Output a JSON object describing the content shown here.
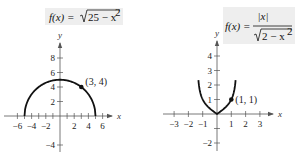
{
  "chart_data": [
    {
      "type": "line",
      "title": "f(x) = √(25 − x²)",
      "formula": {
        "lhs": "f(x) =",
        "radicand": "25 − x",
        "exponent": "2"
      },
      "function": "sqrt(25 - x^2)",
      "domain": [
        -5,
        5
      ],
      "xlabel": "x",
      "ylabel": "y",
      "xlim": [
        -6.5,
        7
      ],
      "ylim": [
        -4.5,
        9.5
      ],
      "x_ticks": [
        -6,
        -4,
        -2,
        2,
        4,
        6
      ],
      "x_tick_labels": [
        "−6",
        "−4",
        "−2",
        "2",
        "4",
        "6"
      ],
      "y_ticks": [
        -4,
        2,
        4,
        6,
        8
      ],
      "y_tick_labels": [
        "−4",
        "2",
        "4",
        "6",
        "8"
      ],
      "x_minor_ticks": [
        -5,
        -3,
        -1,
        1,
        3,
        5
      ],
      "points": [
        {
          "x": 3,
          "y": 4,
          "label": "(3, 4)"
        }
      ],
      "grid": false,
      "colors": {
        "curve": "#111111",
        "axis": "#555555",
        "formula_bg": "#eeeeee"
      }
    },
    {
      "type": "line",
      "title": "f(x) = |x| / √(2 − x²)",
      "formula": {
        "lhs": "f(x) =",
        "numerator": "|x|",
        "radicand": "2 − x",
        "exponent": "2"
      },
      "function": "abs(x) / sqrt(2 - x^2)",
      "domain": [
        -1.3,
        1.3
      ],
      "xlabel": "x",
      "ylabel": "y",
      "xlim": [
        -3.3,
        3.8
      ],
      "ylim": [
        -2.5,
        5
      ],
      "x_ticks": [
        -3,
        -2,
        -1,
        1,
        2,
        3
      ],
      "x_tick_labels": [
        "−3",
        "−2",
        "−1",
        "1",
        "2",
        "3"
      ],
      "y_ticks": [
        -2,
        -1,
        1,
        2,
        3,
        4
      ],
      "y_tick_labels": [
        "−2",
        "",
        "1",
        "2",
        "3",
        "4"
      ],
      "points": [
        {
          "x": 1,
          "y": 1,
          "label": "(1, 1)"
        }
      ],
      "grid": false,
      "colors": {
        "curve": "#111111",
        "axis": "#555555",
        "formula_bg": "#eeeeee"
      }
    }
  ]
}
